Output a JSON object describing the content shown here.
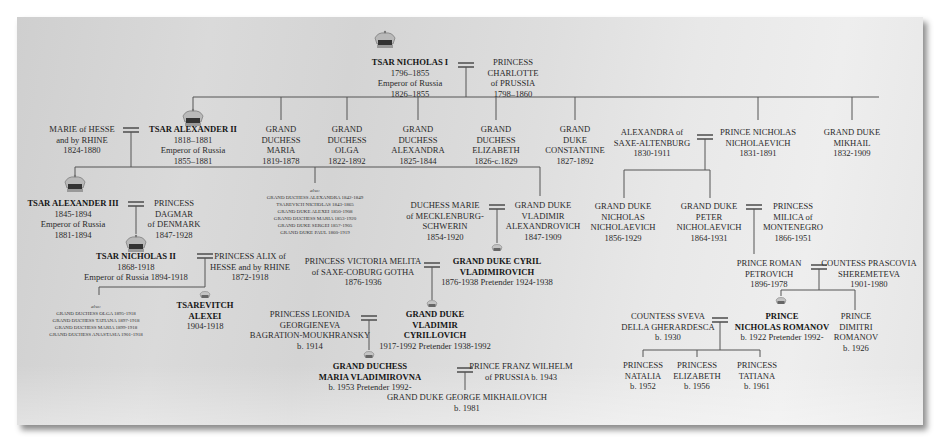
{
  "chart_title": "Romanov Family Tree",
  "colors": {
    "panel_bg": "#d8d8d8",
    "line": "#555555",
    "text": "#2a2a2a",
    "bold_text": "#151515"
  },
  "people": {
    "nicholas1": {
      "name": "TSAR NICHOLAS I",
      "lines": [
        "1796–1855",
        "Emperor of Russia",
        "1826–1855"
      ],
      "bold": true,
      "crown": "large"
    },
    "charlotte": {
      "name": "PRINCESS",
      "lines": [
        "CHARLOTTE",
        "of PRUSSIA",
        "1798–1860"
      ]
    },
    "marie_hesse": {
      "name": "MARIE of HESSE",
      "lines": [
        "and by RHINE",
        "1824-1880"
      ]
    },
    "alexander2": {
      "name": "TSAR ALEXANDER II",
      "lines": [
        "1818–1881",
        "Emperor of Russia",
        "1855–1881"
      ],
      "bold": true,
      "crown": "large"
    },
    "gd_maria": {
      "name": "GRAND",
      "lines": [
        "DUCHESS",
        "MARIA",
        "1819-1878"
      ]
    },
    "gd_olga": {
      "name": "GRAND",
      "lines": [
        "DUCHESS",
        "OLGA",
        "1822-1892"
      ]
    },
    "gd_alexandra": {
      "name": "GRAND",
      "lines": [
        "DUCHESS",
        "ALEXANDRA",
        "1825-1844"
      ]
    },
    "gd_elizabeth": {
      "name": "GRAND",
      "lines": [
        "DUCHESS",
        "ELIZABETH",
        "1826-c.1829"
      ]
    },
    "gd_constantine": {
      "name": "GRAND",
      "lines": [
        "DUKE",
        "CONSTANTINE",
        "1827-1892"
      ]
    },
    "alexandra_saxe": {
      "name": "ALEXANDRA of",
      "lines": [
        "SAXE-ALTENBURG",
        "1830-1911"
      ]
    },
    "nicholas_nich": {
      "name": "PRINCE NICHOLAS",
      "lines": [
        "NICHOLAEVICH",
        "1831-1891"
      ]
    },
    "gd_mikhail": {
      "name": "GRAND DUKE",
      "lines": [
        "MIKHAIL",
        "1832-1909"
      ]
    },
    "alexander3": {
      "name": "TSAR ALEXANDER III",
      "lines": [
        "1845-1894",
        "Emperor of Russia",
        "1881-1894"
      ],
      "bold": true,
      "crown": "large"
    },
    "dagmar": {
      "name": "PRINCESS",
      "lines": [
        "DAGMAR",
        "of DENMARK",
        "1847-1928"
      ]
    },
    "marie_meck": {
      "name": "DUCHESS MARIE",
      "lines": [
        "of MECKLENBURG-",
        "SCHWERIN",
        "1854-1920"
      ]
    },
    "vladimir_alex": {
      "name": "GRAND DUKE",
      "lines": [
        "VLADIMIR",
        "ALEXANDROVICH",
        "1847-1909"
      ]
    },
    "gd_nicholas_nich": {
      "name": "GRAND DUKE",
      "lines": [
        "NICHOLAS",
        "NICHOLAEVICH",
        "1856-1929"
      ]
    },
    "gd_peter": {
      "name": "GRAND DUKE",
      "lines": [
        "PETER",
        "NICHOLAEVICH",
        "1864-1931"
      ]
    },
    "milica": {
      "name": "PRINCESS",
      "lines": [
        "MILICA of",
        "MONTENEGRO",
        "1866-1951"
      ]
    },
    "nicholas2": {
      "name": "TSAR NICHOLAS II",
      "lines": [
        "1868-1918",
        "Emperor of Russia 1894-1918"
      ],
      "bold": true,
      "crown": "large"
    },
    "alix": {
      "name": "PRINCESS ALIX of",
      "lines": [
        "HESSE and by RHINE",
        "1872-1918"
      ]
    },
    "victoria_melita": {
      "name": "PRINCESS VICTORIA MELITA",
      "lines": [
        "of SAXE-COBURG GOTHA",
        "1876-1936"
      ]
    },
    "cyril": {
      "name": "GRAND DUKE CYRIL",
      "name2": "VLADIMIROVICH",
      "lines": [
        "1876-1938 Pretender 1924-1938"
      ],
      "bold": true,
      "crown": "small"
    },
    "roman": {
      "name": "PRINCE ROMAN",
      "lines": [
        "PETROVICH",
        "1896-1978"
      ]
    },
    "prascovia": {
      "name": "COUNTESS PRASCOVIA",
      "lines": [
        "SHEREMETEVA",
        "1901-1980"
      ]
    },
    "alexei": {
      "name": "TSAREVITCH",
      "name2": "ALEXEI",
      "lines": [
        "1904-1918"
      ],
      "bold": true,
      "crown": "small"
    },
    "leonida": {
      "name": "PRINCESS LEONIDA",
      "lines": [
        "GEORGIENEVA",
        "BAGRATION-MOUKHRANSKY",
        "b. 1914"
      ]
    },
    "vladimir_cyr": {
      "name": "GRAND DUKE",
      "name2": "VLADIMIR",
      "name3": "CYRILLOVICH",
      "lines": [
        "1917-1992 Pretender 1938-1992"
      ],
      "bold": true,
      "crown": "small"
    },
    "sveva": {
      "name": "COUNTESS SVEVA",
      "lines": [
        "DELLA GHERARDESCA",
        "b. 1930"
      ]
    },
    "nicholas_romanov": {
      "name": "PRINCE",
      "name2": "NICHOLAS ROMANOV",
      "lines": [
        "b. 1922 Pretender 1992-"
      ],
      "bold": true,
      "crown": "small"
    },
    "dimitri": {
      "name": "PRINCE",
      "lines": [
        "DIMITRI",
        "ROMANOV",
        "b. 1926"
      ]
    },
    "maria_vlad": {
      "name": "GRAND DUCHESS",
      "name2": "MARIA VLADIMIROVNA",
      "lines": [
        "b. 1953 Pretender 1992-"
      ],
      "bold": true,
      "crown": "small"
    },
    "franz_wilhelm": {
      "name": "PRINCE FRANZ WILHELM",
      "lines": [
        "of PRUSSIA b. 1943"
      ]
    },
    "george": {
      "name": "GRAND DUKE GEORGE MIKHAILOVICH",
      "lines": [
        "b. 1981"
      ]
    },
    "natalia": {
      "name": "PRINCESS",
      "lines": [
        "NATALIA",
        "b. 1952"
      ]
    },
    "elizabeth": {
      "name": "PRINCESS",
      "lines": [
        "ELIZABETH",
        "b. 1956"
      ]
    },
    "tatiana": {
      "name": "PRINCESS",
      "lines": [
        "TATIANA",
        "b. 1961"
      ]
    }
  },
  "also_alexander2": {
    "label": "also:",
    "items": [
      "GRAND DUCHESS ALEXANDRA 1842-1849",
      "TSAREVICH NICHOLAS 1843-1865",
      "GRAND DUKE ALEXEI 1850-1908",
      "GRAND DUCHESS MARIA 1853-1920",
      "GRAND DUKE SERGEI 1857-1905",
      "GRAND DUKE PAUL 1860-1919"
    ]
  },
  "also_nicholas2": {
    "label": "also:",
    "items": [
      "GRAND DUCHESS OLGA 1895-1918",
      "GRAND DUCHESS TATIANA 1897-1918",
      "GRAND DUCHESS MARIA 1899-1918",
      "GRAND DUCHESS ANASTASIA 1901-1918"
    ]
  }
}
